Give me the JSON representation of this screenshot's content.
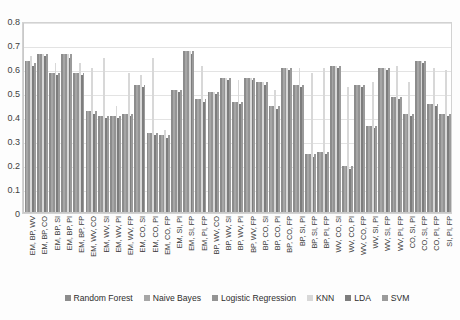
{
  "chart_data": {
    "type": "bar",
    "title": "",
    "xlabel": "",
    "ylabel": "",
    "ylim": [
      0,
      0.8
    ],
    "grid": true,
    "legend_position": "bottom",
    "ytick_labels": [
      "0.8",
      "0.7",
      "0.6",
      "0.5",
      "0.4",
      "0.3",
      "0.2",
      "0.1",
      "0"
    ],
    "ytick_values": [
      0.8,
      0.7,
      0.6,
      0.5,
      0.4,
      0.3,
      0.2,
      0.1,
      0
    ],
    "categories": [
      "EM, BP, WV",
      "EM, BP, CO",
      "EM, BP, SI",
      "EM, BP, PI",
      "EM, BP, FP",
      "EM, WV, CO",
      "EM, WV, SI",
      "EM, WV, PI",
      "EM, WV, FP",
      "EM, CO, SI",
      "EM, CO, PI",
      "EM, CO, FP",
      "EM, SI, PI",
      "EM, SI, FP",
      "EM, PI, FP",
      "BP, WV, CO",
      "BP, WV, SI",
      "BP, WV, PI",
      "BP, WV, FP",
      "BP, CO, SI",
      "BP, CO, PI",
      "BP, CO, FP",
      "BP, SI, PI",
      "BP, SI, FP",
      "BP, PI, FP",
      "WV, CO, SI",
      "WV, CO, PI",
      "WV, CO, FP",
      "WV, SI, PI",
      "WV, SI, FP",
      "WV, PI, FP",
      "CO, SI, PI",
      "CO, SI, FP",
      "CO, PI, FP",
      "SI, PI, FP"
    ],
    "series": [
      {
        "name": "Random Forest",
        "color": "#8c8c8c",
        "values": [
          0.63,
          0.66,
          0.58,
          0.66,
          0.58,
          0.42,
          0.4,
          0.4,
          0.41,
          0.53,
          0.33,
          0.32,
          0.51,
          0.67,
          0.47,
          0.5,
          0.56,
          0.46,
          0.56,
          0.54,
          0.44,
          0.6,
          0.53,
          0.24,
          0.25,
          0.61,
          0.19,
          0.53,
          0.36,
          0.6,
          0.48,
          0.41,
          0.63,
          0.45,
          0.41
        ]
      },
      {
        "name": "Naive Bayes",
        "color": "#a6a6a6",
        "values": [
          0.63,
          0.66,
          0.58,
          0.66,
          0.58,
          0.42,
          0.4,
          0.4,
          0.41,
          0.53,
          0.33,
          0.32,
          0.51,
          0.67,
          0.47,
          0.5,
          0.56,
          0.46,
          0.56,
          0.54,
          0.44,
          0.6,
          0.53,
          0.24,
          0.25,
          0.61,
          0.19,
          0.53,
          0.36,
          0.6,
          0.48,
          0.41,
          0.63,
          0.45,
          0.41
        ]
      },
      {
        "name": "Logistic Regression",
        "color": "#949494",
        "values": [
          0.63,
          0.66,
          0.58,
          0.66,
          0.58,
          0.42,
          0.4,
          0.4,
          0.41,
          0.53,
          0.33,
          0.32,
          0.51,
          0.67,
          0.47,
          0.5,
          0.56,
          0.46,
          0.56,
          0.54,
          0.44,
          0.6,
          0.53,
          0.24,
          0.25,
          0.61,
          0.19,
          0.53,
          0.36,
          0.6,
          0.48,
          0.41,
          0.63,
          0.45,
          0.41
        ]
      },
      {
        "name": "KNN",
        "color": "#d8d8d8",
        "values": [
          0.65,
          0.66,
          0.62,
          0.66,
          0.62,
          0.6,
          0.64,
          0.44,
          0.58,
          0.57,
          0.64,
          0.34,
          0.51,
          0.67,
          0.61,
          0.5,
          0.56,
          0.55,
          0.56,
          0.54,
          0.51,
          0.6,
          0.6,
          0.58,
          0.6,
          0.61,
          0.52,
          0.53,
          0.54,
          0.6,
          0.61,
          0.54,
          0.63,
          0.6,
          0.59
        ]
      },
      {
        "name": "LDA",
        "color": "#7d7d7d",
        "values": [
          0.61,
          0.65,
          0.57,
          0.64,
          0.57,
          0.41,
          0.39,
          0.39,
          0.4,
          0.52,
          0.32,
          0.31,
          0.5,
          0.66,
          0.46,
          0.49,
          0.55,
          0.45,
          0.55,
          0.53,
          0.43,
          0.59,
          0.52,
          0.23,
          0.24,
          0.6,
          0.18,
          0.52,
          0.35,
          0.59,
          0.47,
          0.4,
          0.62,
          0.44,
          0.4
        ]
      },
      {
        "name": "SVM",
        "color": "#9b9b9b",
        "values": [
          0.62,
          0.66,
          0.58,
          0.66,
          0.58,
          0.42,
          0.4,
          0.4,
          0.41,
          0.53,
          0.33,
          0.32,
          0.51,
          0.67,
          0.47,
          0.5,
          0.56,
          0.46,
          0.56,
          0.54,
          0.44,
          0.6,
          0.53,
          0.24,
          0.25,
          0.61,
          0.19,
          0.53,
          0.36,
          0.6,
          0.48,
          0.41,
          0.63,
          0.45,
          0.41
        ]
      }
    ]
  }
}
